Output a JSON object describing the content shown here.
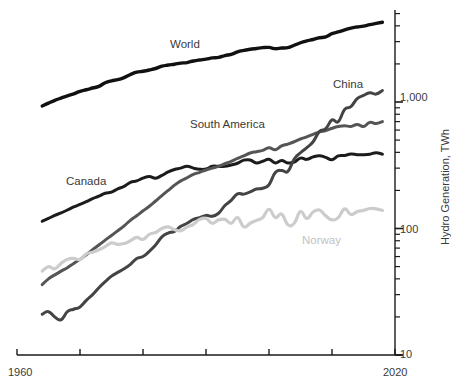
{
  "chart_data": {
    "type": "line",
    "title": "",
    "xlabel": "",
    "ylabel": "Hydro Generation, TWh",
    "yscale": "log",
    "ylim": [
      10,
      5000
    ],
    "xlim": [
      1960,
      2020
    ],
    "grid": false,
    "legend_position": "inline-labels",
    "x_ticks": [
      "1960",
      "",
      "",
      "",
      "",
      "",
      "2020"
    ],
    "x_tick_values": [
      1960,
      1970,
      1980,
      1990,
      2000,
      2010,
      2020
    ],
    "y_ticks": [
      "1,000",
      "100",
      "10"
    ],
    "y_tick_values": [
      1000,
      100,
      10
    ],
    "x_axis_start_label": "1960",
    "x_axis_end_label": "2020",
    "series": [
      {
        "name": "World",
        "label": "World",
        "color": "#111111",
        "width": 3.4,
        "label_x": 170,
        "label_y": 38,
        "x": [
          1964,
          1965,
          1966,
          1967,
          1968,
          1969,
          1970,
          1971,
          1972,
          1973,
          1974,
          1975,
          1976,
          1977,
          1978,
          1979,
          1980,
          1981,
          1982,
          1983,
          1984,
          1985,
          1986,
          1987,
          1988,
          1989,
          1990,
          1991,
          1992,
          1993,
          1994,
          1995,
          1996,
          1997,
          1998,
          1999,
          2000,
          2001,
          2002,
          2003,
          2004,
          2005,
          2006,
          2007,
          2008,
          2009,
          2010,
          2011,
          2012,
          2013,
          2014,
          2015,
          2016,
          2017,
          2018
        ],
        "values": [
          930,
          980,
          1030,
          1075,
          1120,
          1160,
          1215,
          1250,
          1290,
          1330,
          1420,
          1470,
          1500,
          1560,
          1650,
          1720,
          1750,
          1790,
          1840,
          1920,
          1960,
          1990,
          2030,
          2050,
          2110,
          2150,
          2180,
          2230,
          2250,
          2330,
          2380,
          2490,
          2560,
          2610,
          2650,
          2690,
          2700,
          2640,
          2670,
          2690,
          2810,
          2940,
          3040,
          3120,
          3220,
          3270,
          3470,
          3580,
          3710,
          3840,
          3920,
          3980,
          4090,
          4180,
          4270
        ]
      },
      {
        "name": "Canada",
        "label": "Canada",
        "color": "#1c1c1c",
        "width": 3.0,
        "label_x": 66,
        "label_y": 175,
        "x": [
          1964,
          1965,
          1966,
          1967,
          1968,
          1969,
          1970,
          1971,
          1972,
          1973,
          1974,
          1975,
          1976,
          1977,
          1978,
          1979,
          1980,
          1981,
          1982,
          1983,
          1984,
          1985,
          1986,
          1987,
          1988,
          1989,
          1990,
          1991,
          1992,
          1993,
          1994,
          1995,
          1996,
          1997,
          1998,
          1999,
          2000,
          2001,
          2002,
          2003,
          2004,
          2005,
          2006,
          2007,
          2008,
          2009,
          2010,
          2011,
          2012,
          2013,
          2014,
          2015,
          2016,
          2017,
          2018
        ],
        "values": [
          114,
          120,
          127,
          133,
          140,
          148,
          155,
          163,
          172,
          180,
          190,
          194,
          206,
          215,
          232,
          238,
          250,
          258,
          250,
          263,
          280,
          293,
          300,
          310,
          300,
          294,
          295,
          310,
          310,
          310,
          318,
          328,
          347,
          348,
          330,
          340,
          352,
          330,
          345,
          330,
          335,
          360,
          352,
          368,
          376,
          365,
          350,
          375,
          378,
          388,
          383,
          383,
          387,
          397,
          387
        ]
      },
      {
        "name": "South America",
        "label": "South America",
        "color": "#555555",
        "width": 3.0,
        "label_x": 190,
        "label_y": 118,
        "x": [
          1964,
          1965,
          1966,
          1967,
          1968,
          1969,
          1970,
          1971,
          1972,
          1973,
          1974,
          1975,
          1976,
          1977,
          1978,
          1979,
          1980,
          1981,
          1982,
          1983,
          1984,
          1985,
          1986,
          1987,
          1988,
          1989,
          1990,
          1991,
          1992,
          1993,
          1994,
          1995,
          1996,
          1997,
          1998,
          1999,
          2000,
          2001,
          2002,
          2003,
          2004,
          2005,
          2006,
          2007,
          2008,
          2009,
          2010,
          2011,
          2012,
          2013,
          2014,
          2015,
          2016,
          2017,
          2018
        ],
        "values": [
          36,
          40,
          43,
          46,
          49,
          53,
          57,
          62,
          68,
          74,
          81,
          88,
          96,
          105,
          116,
          126,
          138,
          150,
          165,
          182,
          200,
          220,
          238,
          252,
          268,
          278,
          290,
          300,
          310,
          325,
          340,
          358,
          375,
          395,
          405,
          415,
          435,
          420,
          450,
          465,
          485,
          510,
          530,
          555,
          580,
          595,
          620,
          640,
          650,
          640,
          665,
          640,
          690,
          675,
          700
        ]
      },
      {
        "name": "China",
        "label": "China",
        "color": "#444444",
        "width": 3.0,
        "label_x": 333,
        "label_y": 78,
        "x": [
          1964,
          1965,
          1966,
          1967,
          1968,
          1969,
          1970,
          1971,
          1972,
          1973,
          1974,
          1975,
          1976,
          1977,
          1978,
          1979,
          1980,
          1981,
          1982,
          1983,
          1984,
          1985,
          1986,
          1987,
          1988,
          1989,
          1990,
          1991,
          1992,
          1993,
          1994,
          1995,
          1996,
          1997,
          1998,
          1999,
          2000,
          2001,
          2002,
          2003,
          2004,
          2005,
          2006,
          2007,
          2008,
          2009,
          2010,
          2011,
          2012,
          2013,
          2014,
          2015,
          2016,
          2017,
          2018
        ],
        "values": [
          21,
          22,
          20,
          19,
          22,
          23,
          24,
          27,
          30,
          34,
          38,
          42,
          45,
          48,
          52,
          58,
          60,
          66,
          74,
          86,
          92,
          95,
          104,
          110,
          118,
          122,
          127,
          125,
          132,
          152,
          167,
          188,
          187,
          195,
          205,
          208,
          222,
          277,
          288,
          283,
          354,
          397,
          436,
          485,
          585,
          615,
          722,
          699,
          873,
          920,
          1064,
          1126,
          1181,
          1155,
          1232
        ]
      },
      {
        "name": "Norway",
        "label": "Norway",
        "color": "#cccccc",
        "width": 3.2,
        "label_x": 302,
        "label_y": 234,
        "x": [
          1964,
          1965,
          1966,
          1967,
          1968,
          1969,
          1970,
          1971,
          1972,
          1973,
          1974,
          1975,
          1976,
          1977,
          1978,
          1979,
          1980,
          1981,
          1982,
          1983,
          1984,
          1985,
          1986,
          1987,
          1988,
          1989,
          1990,
          1991,
          1992,
          1993,
          1994,
          1995,
          1996,
          1997,
          1998,
          1999,
          2000,
          2001,
          2002,
          2003,
          2004,
          2005,
          2006,
          2007,
          2008,
          2009,
          2010,
          2011,
          2012,
          2013,
          2014,
          2015,
          2016,
          2017,
          2018
        ],
        "values": [
          46,
          50,
          48,
          53,
          57,
          58,
          57,
          63,
          65,
          68,
          72,
          77,
          75,
          76,
          80,
          85,
          82,
          90,
          93,
          100,
          103,
          98,
          96,
          103,
          108,
          118,
          120,
          110,
          117,
          118,
          110,
          122,
          103,
          110,
          116,
          122,
          142,
          122,
          130,
          107,
          110,
          136,
          120,
          135,
          140,
          126,
          117,
          122,
          143,
          129,
          136,
          139,
          144,
          143,
          139
        ]
      }
    ]
  },
  "axis": {
    "y_title": "Hydro Generation, TWh",
    "x_start": "1960",
    "x_end": "2020",
    "y_label_1000": "1,000",
    "y_label_100": "100",
    "y_label_10": "10"
  },
  "colors": {
    "axis": "#1a1a1a",
    "text": "#3a3a3a",
    "muted_text": "#c2c2c2",
    "background": "#ffffff"
  }
}
